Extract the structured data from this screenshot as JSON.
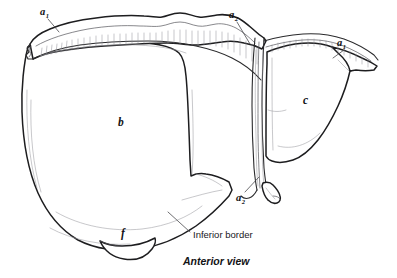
{
  "figure": {
    "caption": "Anterior view",
    "view": "Anterior view",
    "style": "line drawing"
  },
  "colors": {
    "background": "#ffffff",
    "outline": "#1d1d1f",
    "secondary_line": "#55555a",
    "hatching": "#8d8d94",
    "leader_line": "#4a4a4e",
    "label_text": "#111114"
  },
  "labels": {
    "a1_left": {
      "base": "a",
      "sub": "1",
      "text": "a1"
    },
    "a2_top": {
      "base": "a",
      "sub": "2",
      "text": "a2"
    },
    "a1_right": {
      "base": "a",
      "sub": "1",
      "text": "a1"
    },
    "a2_bottom": {
      "base": "a",
      "sub": "2",
      "text": "a2"
    },
    "b": {
      "text": "b"
    },
    "c": {
      "text": "c"
    },
    "f": {
      "text": "f"
    },
    "inferior_border": {
      "text": "Inferior border"
    }
  },
  "leader_lines": [
    {
      "name": "a1-left-leader",
      "from_label": "a1_left",
      "to_structure": "coronary-ligament-left"
    },
    {
      "name": "a2-top-leader",
      "from_label": "a2_top",
      "to_structure": "falciform-ligament-top"
    },
    {
      "name": "a1-right-leader",
      "from_label": "a1_right",
      "to_structure": "coronary-ligament-right"
    },
    {
      "name": "a2-bottom-leader",
      "from_label": "a2_bottom",
      "to_structure": "round-ligament"
    },
    {
      "name": "inferior-border-leader",
      "from_label": "inferior_border",
      "to_structure": "inferior-border-edge"
    }
  ],
  "structures": [
    {
      "key": "a1_left",
      "name": "coronary-ligament-left"
    },
    {
      "key": "a2_top",
      "name": "falciform-ligament"
    },
    {
      "key": "a1_right",
      "name": "coronary-ligament-right"
    },
    {
      "key": "a2_bottom",
      "name": "round-ligament"
    },
    {
      "key": "b",
      "name": "right-lobe"
    },
    {
      "key": "c",
      "name": "left-lobe"
    },
    {
      "key": "f",
      "name": "gallbladder"
    },
    {
      "key": "inferior_border",
      "name": "inferior-border"
    }
  ]
}
